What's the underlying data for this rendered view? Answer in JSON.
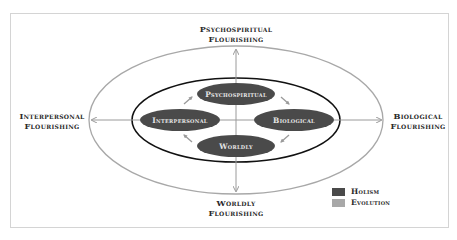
{
  "diagram": {
    "outer_labels": {
      "top": [
        "Psychospiritual",
        "Flourishing"
      ],
      "left": [
        "Interpersonal",
        "Flourishing"
      ],
      "right": [
        "Biological",
        "Flourishing"
      ],
      "bottom": [
        "Worldly",
        "Flourishing"
      ]
    },
    "nodes": [
      {
        "id": "psychospiritual",
        "label": "Psychospiritual",
        "cx": 236,
        "cy": 94
      },
      {
        "id": "interpersonal",
        "label": "Interpersonal",
        "cx": 180,
        "cy": 120
      },
      {
        "id": "biological",
        "label": "Biological",
        "cx": 294,
        "cy": 120
      },
      {
        "id": "worldly",
        "label": "Worldly",
        "cx": 236,
        "cy": 146
      }
    ],
    "legend": [
      {
        "label": "Holism",
        "color": "#4a4a4a"
      },
      {
        "label": "Evolution",
        "color": "#a8a8a8"
      }
    ],
    "colors": {
      "node_fill": "#4a4a4a",
      "node_text": "#e6e6e6",
      "outer_ellipse": "#a8a8a8",
      "inner_ellipse": "#111111",
      "arrow": "#9a9a9a"
    }
  }
}
